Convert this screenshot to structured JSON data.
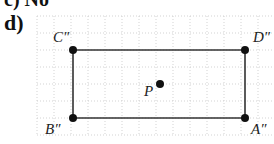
{
  "previous_part_label": "c) No",
  "part_label": "d)",
  "figure": {
    "type": "rectangle-on-grid",
    "grid": {
      "x0": 37,
      "y0": 16,
      "cols": 14,
      "rows": 7,
      "spacing": 17
    },
    "points": [
      {
        "name": "C''",
        "x": 73,
        "y": 50
      },
      {
        "name": "D''",
        "x": 245,
        "y": 50
      },
      {
        "name": "A''",
        "x": 245,
        "y": 118
      },
      {
        "name": "B''",
        "x": 73,
        "y": 118
      },
      {
        "name": "P",
        "x": 160,
        "y": 84
      }
    ],
    "colors": {
      "grid": "#c8c8c8",
      "lines": "#333333",
      "points": "#111111"
    }
  }
}
